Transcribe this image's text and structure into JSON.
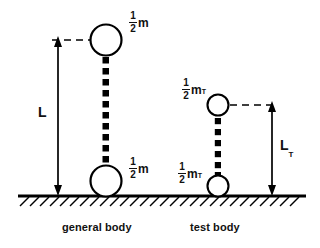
{
  "figure": {
    "background_color": "#ffffff",
    "ink_color": "#000000",
    "ground": {
      "name": "ground-line",
      "hatching": "right-slanted",
      "x_start": 18,
      "x_end": 306,
      "y": 196
    },
    "bodies": [
      {
        "id": "general-body",
        "caption": "general body",
        "top_mass_label": {
          "numerator": "1",
          "denominator": "2",
          "symbol": "m",
          "subscript": ""
        },
        "bottom_mass_label": {
          "numerator": "1",
          "denominator": "2",
          "symbol": "m",
          "subscript": ""
        },
        "dimension_label": {
          "symbol": "L",
          "subscript": ""
        },
        "circle_diameter_px": 31,
        "rod_style": "dotted-squares",
        "top_circle_center": {
          "x": 106,
          "y": 40
        },
        "bottom_circle_center": {
          "x": 106,
          "y": 181
        }
      },
      {
        "id": "test-body",
        "caption": "test body",
        "top_mass_label": {
          "numerator": "1",
          "denominator": "2",
          "symbol": "m",
          "subscript": "T"
        },
        "bottom_mass_label": {
          "numerator": "1",
          "denominator": "2",
          "symbol": "m",
          "subscript": "T"
        },
        "dimension_label": {
          "symbol": "L",
          "subscript": "T"
        },
        "circle_diameter_px": 21,
        "rod_style": "dotted-squares",
        "top_circle_center": {
          "x": 218,
          "y": 105
        },
        "bottom_circle_center": {
          "x": 218,
          "y": 186
        }
      }
    ],
    "measure_arrows": [
      {
        "id": "L-arrow",
        "orientation": "vertical",
        "heads": "both",
        "x": 58,
        "y_top": 40,
        "y_bottom": 196
      },
      {
        "id": "LT-arrow",
        "orientation": "vertical",
        "heads": "both",
        "x": 272,
        "y_top": 105,
        "y_bottom": 196
      }
    ],
    "leader_lines": [
      {
        "id": "L-leader",
        "style": "dashed",
        "from_x": 52,
        "to_x": 90,
        "y": 40
      },
      {
        "id": "LT-leader",
        "style": "dashed",
        "from_x": 230,
        "to_x": 278,
        "y": 105
      }
    ]
  }
}
